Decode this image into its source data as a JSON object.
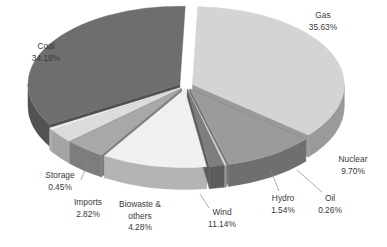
{
  "chart_data": {
    "type": "pie",
    "title": "",
    "subtitle": "",
    "xlabel": "",
    "ylabel": "",
    "legend_position": "none",
    "grid": false,
    "style": "exploded-3d-pie",
    "background_color": "#ffffff",
    "label_color": "#3a3a3a",
    "value_suffix": "%",
    "categories": [
      "Gas",
      "Nuclear",
      "Oil",
      "Hydro",
      "Wind",
      "Biowaste & others",
      "Imports",
      "Storage",
      "Coal"
    ],
    "values": [
      35.63,
      9.7,
      0.26,
      1.54,
      11.14,
      4.28,
      2.82,
      0.45,
      34.18
    ],
    "slices": [
      {
        "name": "Gas",
        "label": "Gas",
        "value": 35.63,
        "value_text": "35.63%",
        "top_color": "#d4d4d4",
        "side_color": "#9a9a9a",
        "label_x": 323,
        "label_y": 16,
        "label_lines": [
          "Gas",
          "35.63%"
        ],
        "leader": null
      },
      {
        "name": "Nuclear",
        "label": "Nuclear",
        "value": 9.7,
        "value_text": "9.70%",
        "top_color": "#9b9b9b",
        "side_color": "#6f6f6f",
        "label_x": 353,
        "label_y": 160,
        "label_lines": [
          "Nuclear",
          "9.70%"
        ],
        "leader": null
      },
      {
        "name": "Oil",
        "label": "Oil",
        "value": 0.26,
        "value_text": "0.26%",
        "top_color": "#cfcfcf",
        "side_color": "#959595",
        "label_x": 330,
        "label_y": 199,
        "label_lines": [
          "Oil",
          "0.26%"
        ],
        "leader": {
          "x1": 322,
          "y1": 192,
          "x2": 297,
          "y2": 170
        }
      },
      {
        "name": "Hydro",
        "label": "Hydro",
        "value": 1.54,
        "value_text": "1.54%",
        "top_color": "#7e7e7e",
        "side_color": "#5c5c5c",
        "label_x": 283,
        "label_y": 199,
        "label_lines": [
          "Hydro",
          "1.54%"
        ],
        "leader": {
          "x1": 279,
          "y1": 191,
          "x2": 271,
          "y2": 171
        }
      },
      {
        "name": "Wind",
        "label": "Wind",
        "value": 11.14,
        "value_text": "11.14%",
        "top_color": "#f0f0f0",
        "side_color": "#b4b4b4",
        "label_x": 222,
        "label_y": 213,
        "label_lines": [
          "Wind",
          "11.14%"
        ],
        "leader": {
          "x1": 209,
          "y1": 208,
          "x2": 200,
          "y2": 194
        }
      },
      {
        "name": "Biowaste & others",
        "label": "Biowaste &",
        "value": 4.28,
        "value_text": "4.28%",
        "top_color": "#a8a8a8",
        "side_color": "#7d7d7d",
        "label_x": 140,
        "label_y": 205,
        "label_lines": [
          "Biowaste &",
          "others",
          "4.28%"
        ],
        "leader": null
      },
      {
        "name": "Imports",
        "label": "Imports",
        "value": 2.82,
        "value_text": "2.82%",
        "top_color": "#dcdcdc",
        "side_color": "#a4a4a4",
        "label_x": 88,
        "label_y": 203,
        "label_lines": [
          "Imports",
          "2.82%"
        ],
        "leader": null
      },
      {
        "name": "Storage",
        "label": "Storage",
        "value": 0.45,
        "value_text": "0.45%",
        "top_color": "#ececec",
        "side_color": "#b0b0b0",
        "label_x": 60,
        "label_y": 176,
        "label_lines": [
          "Storage",
          "0.45%"
        ],
        "leader": {
          "x1": 81,
          "y1": 180,
          "x2": 88,
          "y2": 162
        }
      },
      {
        "name": "Coal",
        "label": "Coal",
        "value": 34.18,
        "value_text": "34.18%",
        "top_color": "#6e6e6e",
        "side_color": "#525252",
        "label_x": 46,
        "label_y": 47,
        "label_lines": [
          "Coal",
          "34.18%"
        ],
        "leader": null
      }
    ],
    "geometry": {
      "center_x": 186,
      "center_y": 86,
      "radius_x": 152,
      "radius_y": 78,
      "depth": 22,
      "start_angle_deg": -88,
      "explode": 7
    }
  }
}
